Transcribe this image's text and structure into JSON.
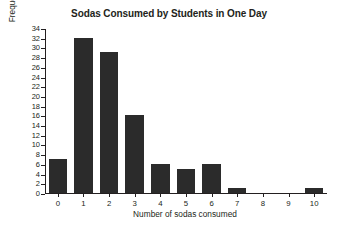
{
  "chart_data": {
    "type": "bar",
    "title": "Sodas Consumed by Students in One Day",
    "xlabel": "Number of sodas consumed",
    "ylabel": "Frequency of number of sodas",
    "categories": [
      "0",
      "1",
      "2",
      "3",
      "4",
      "5",
      "6",
      "7",
      "8",
      "9",
      "10"
    ],
    "values": [
      7,
      32,
      29,
      16,
      6,
      5,
      6,
      1,
      0,
      0,
      1
    ],
    "ylim": [
      0,
      34
    ],
    "ytick_step": 2,
    "yticks": [
      0,
      2,
      4,
      6,
      8,
      10,
      12,
      14,
      16,
      18,
      20,
      22,
      24,
      26,
      28,
      30,
      32,
      34
    ],
    "xticks": [
      "0",
      "1",
      "2",
      "3",
      "4",
      "5",
      "6",
      "7",
      "8",
      "9",
      "10"
    ],
    "grid": false,
    "legend": null,
    "bar_color": "#2b2b2b",
    "axis_color": "#231f20",
    "background_color": "#ffffff"
  }
}
